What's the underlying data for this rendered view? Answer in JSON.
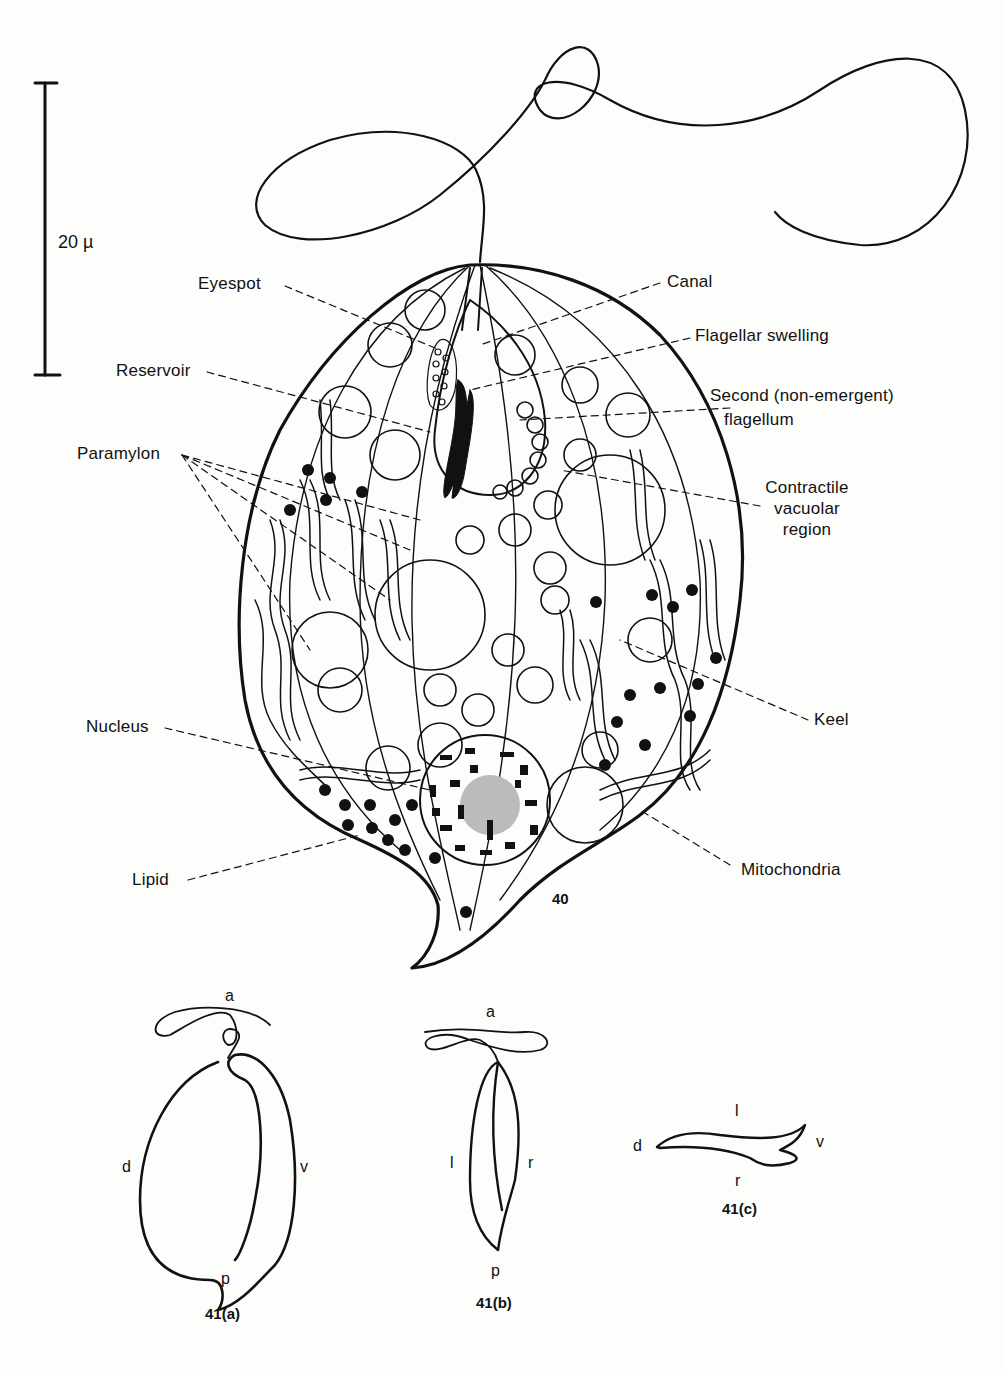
{
  "scale_bar": {
    "label": "20 µ"
  },
  "figure_40": {
    "number": "40",
    "labels": {
      "eyespot": "Eyespot",
      "reservoir": "Reservoir",
      "paramylon": "Paramylon",
      "nucleus": "Nucleus",
      "lipid": "Lipid",
      "canal": "Canal",
      "flagellar_swelling": "Flagellar swelling",
      "second_flagellum_line1": "Second (non-emergent)",
      "second_flagellum_line2": "flagellum",
      "contractile_line1": "Contractile",
      "contractile_line2": "vacuolar",
      "contractile_line3": "region",
      "keel": "Keel",
      "mitochondria": "Mitochondria"
    }
  },
  "figure_41a": {
    "caption": "41(a)",
    "top": "a",
    "bottom": "p",
    "left": "d",
    "right": "v"
  },
  "figure_41b": {
    "caption": "41(b)",
    "top": "a",
    "bottom": "p",
    "left": "l",
    "right": "r"
  },
  "figure_41c": {
    "caption": "41(c)",
    "top": "l",
    "bottom": "r",
    "left": "d",
    "right": "v"
  },
  "colors": {
    "ink": "#111111",
    "paper": "#fdfdfb"
  }
}
